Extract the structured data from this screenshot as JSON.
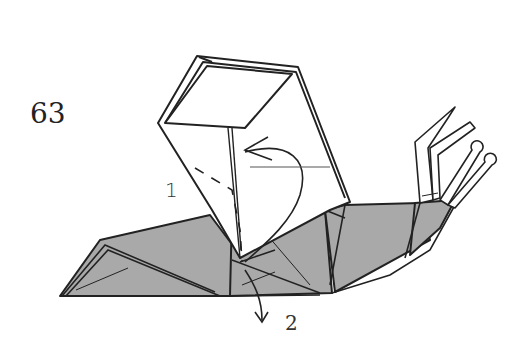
{
  "diagram": {
    "step_number": "63",
    "annotations": {
      "step1": "1",
      "step2": "2"
    },
    "colors": {
      "paper_fill": "#a9a9a9",
      "line": "#222222",
      "background": "#ffffff"
    },
    "elements": [
      "step-number",
      "folded-paper-body",
      "raised-flap",
      "antenna-tentacles",
      "curved-fold-arrow-1",
      "pull-down-arrow-2",
      "dashed-valley-fold-line"
    ]
  }
}
